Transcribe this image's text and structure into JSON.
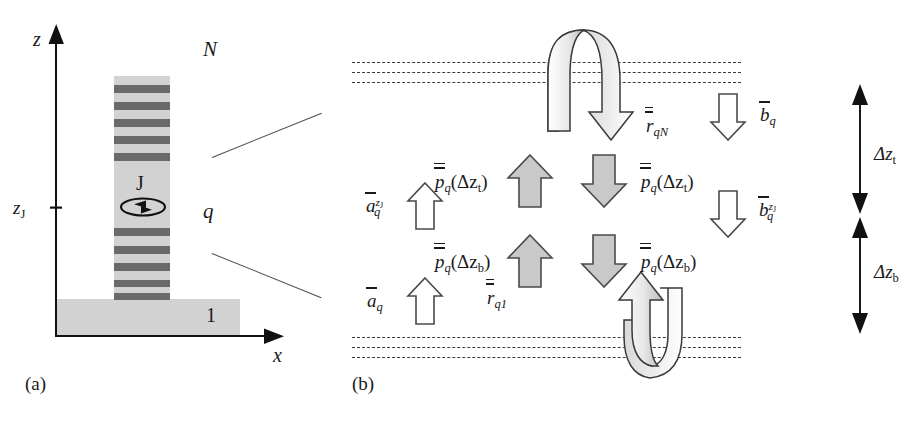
{
  "figure": {
    "panel_a": {
      "tag": "(a)",
      "axis_z": "z",
      "axis_x": "x",
      "tick_zJ_label": "z",
      "tick_zJ_sub": "J",
      "current_source": "J",
      "layer_top": "N",
      "layer_middle": "q",
      "layer_bottom": "1"
    },
    "panel_b": {
      "tag": "(b)",
      "reflection_top": {
        "base": "r",
        "sub": "qN",
        "bars": 2
      },
      "reflection_bottom": {
        "base": "r",
        "sub": "q1",
        "bars": 2
      },
      "flux_up_top": {
        "base": "p",
        "sub": "q",
        "arg": "(Δz",
        "arg_sub": "t",
        "arg_end": ")",
        "bars": 2
      },
      "flux_down_top": {
        "base": "p",
        "sub": "q",
        "arg": "(Δz",
        "arg_sub": "t",
        "arg_end": ")",
        "bars": 2
      },
      "flux_up_bottom": {
        "base": "p",
        "sub": "q",
        "arg": "(Δz",
        "arg_sub": "b",
        "arg_end": ")",
        "bars": 2
      },
      "flux_down_bottom": {
        "base": "p",
        "sub": "q",
        "arg": "(Δz",
        "arg_sub": "b",
        "arg_end": ")",
        "bars": 2
      },
      "amp_up_zJ": {
        "base": "a",
        "sub": "q",
        "sup": "z",
        "sup_sub": "J",
        "bars": 1
      },
      "amp_up": {
        "base": "a",
        "sub": "q",
        "bars": 1
      },
      "amp_down": {
        "base": "b",
        "sub": "q",
        "bars": 1
      },
      "amp_down_zJ": {
        "base": "b",
        "sub": "q",
        "sup": "z",
        "sup_sub": "J",
        "bars": 1
      },
      "thickness_top": {
        "text": "Δz",
        "sub": "t"
      },
      "thickness_bottom": {
        "text": "Δz",
        "sub": "b"
      }
    },
    "colors": {
      "slab_fill": "#d2d2d2",
      "stripe_fill": "#6a6a6a",
      "arrow_gray": "#c9c9c9",
      "arrow_white": "#ffffff",
      "ink": "#1a1a1a",
      "dash": "#3b3b3b"
    }
  }
}
